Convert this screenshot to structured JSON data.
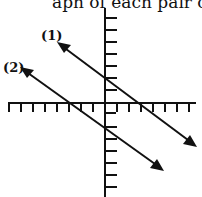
{
  "caption": "aph of each pair of lines.",
  "diagram": {
    "type": "coordinate-plane-parallel-lines",
    "axes": {
      "x_ticks_left": 8,
      "x_ticks_right": 7,
      "y_ticks_up": 8,
      "y_ticks_down": 5
    },
    "lines": [
      {
        "label": "(1)",
        "from": [
          57,
          42
        ],
        "to": [
          196,
          146
        ]
      },
      {
        "label": "(2)",
        "from": [
          20,
          67
        ],
        "to": [
          163,
          170
        ]
      }
    ],
    "colors": {
      "stroke": "#111111",
      "background": "#ffffff"
    }
  }
}
